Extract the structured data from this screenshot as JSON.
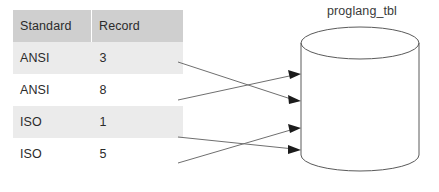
{
  "diagram": {
    "title_visible": false,
    "table": {
      "name": "standards-table",
      "columns": [
        "Standard",
        "Record"
      ],
      "rows": [
        {
          "standard": "ANSI",
          "record": "3",
          "shaded": true
        },
        {
          "standard": "ANSI",
          "record": "8",
          "shaded": false
        },
        {
          "standard": "ISO",
          "record": "1",
          "shaded": true
        },
        {
          "standard": "ISO",
          "record": "5",
          "shaded": false
        }
      ]
    },
    "database": {
      "name": "database-cylinder",
      "label": "proglang_tbl",
      "shape": "cylinder"
    },
    "connectors": [
      {
        "name": "connector-row1",
        "from_row": 0,
        "to_port": 2,
        "from_value": "3"
      },
      {
        "name": "connector-row2",
        "from_row": 1,
        "to_port": 1,
        "from_value": "8"
      },
      {
        "name": "connector-row3",
        "from_row": 2,
        "to_port": 4,
        "from_value": "1"
      },
      {
        "name": "connector-row4",
        "from_row": 3,
        "to_port": 3,
        "from_value": "5"
      }
    ],
    "colors": {
      "header_bg": "#cfcfcf",
      "row_shaded_bg": "#ebebeb",
      "row_plain_bg": "#ffffff",
      "text": "#2b2b2b",
      "connector_line": "#6f6f6f",
      "arrow_head": "#1b1b1b",
      "cylinder_stroke": "#5a5a5a",
      "page_bg": "#ffffff"
    }
  }
}
